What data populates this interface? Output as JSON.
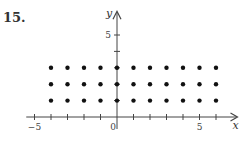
{
  "problem_number": "15.",
  "chart_data": {
    "type": "scatter",
    "title": "",
    "xlabel": "x",
    "ylabel": "y",
    "xlim": [
      -5.5,
      7
    ],
    "ylim": [
      -0.7,
      6.2
    ],
    "x_tick_labels": [
      "-5",
      "0",
      "5"
    ],
    "y_tick_labels": [
      "5"
    ],
    "x_ticks": [
      -5,
      -4,
      -3,
      -2,
      -1,
      0,
      1,
      2,
      3,
      4,
      5,
      6
    ],
    "y_ticks": [
      1,
      2,
      3,
      4,
      5
    ],
    "grid": false,
    "series": [
      {
        "name": "lattice points",
        "points": [
          [
            -4,
            1
          ],
          [
            -3,
            1
          ],
          [
            -2,
            1
          ],
          [
            -1,
            1
          ],
          [
            0,
            1
          ],
          [
            1,
            1
          ],
          [
            2,
            1
          ],
          [
            3,
            1
          ],
          [
            4,
            1
          ],
          [
            5,
            1
          ],
          [
            6,
            1
          ],
          [
            -4,
            2
          ],
          [
            -3,
            2
          ],
          [
            -2,
            2
          ],
          [
            -1,
            2
          ],
          [
            0,
            2
          ],
          [
            1,
            2
          ],
          [
            2,
            2
          ],
          [
            3,
            2
          ],
          [
            4,
            2
          ],
          [
            5,
            2
          ],
          [
            6,
            2
          ],
          [
            -4,
            3
          ],
          [
            -3,
            3
          ],
          [
            -2,
            3
          ],
          [
            -1,
            3
          ],
          [
            0,
            3
          ],
          [
            1,
            3
          ],
          [
            2,
            3
          ],
          [
            3,
            3
          ],
          [
            4,
            3
          ],
          [
            5,
            3
          ],
          [
            6,
            3
          ]
        ]
      }
    ]
  }
}
